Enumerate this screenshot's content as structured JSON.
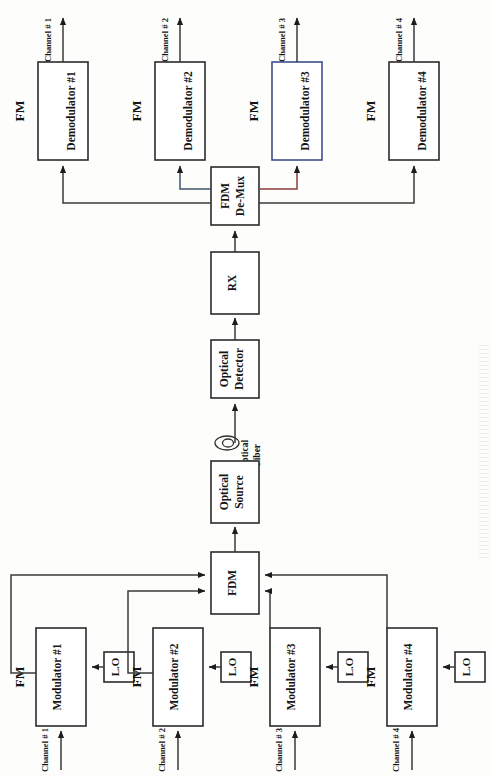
{
  "figure": {
    "kind": "block-diagram",
    "orientation": "rotated-90-ccw"
  },
  "transmitter": {
    "channels": [
      {
        "channel_label": "Channel # 1",
        "fm_label": "FM",
        "block_label": "Modulator #1",
        "lo_label": "L.O"
      },
      {
        "channel_label": "Channel # 2",
        "fm_label": "FM",
        "block_label": "Modulator #2",
        "lo_label": "L.O"
      },
      {
        "channel_label": "Channel # 3",
        "fm_label": "FM",
        "block_label": "Modulator #3",
        "lo_label": "L.O"
      },
      {
        "channel_label": "Channel # 4",
        "fm_label": "FM",
        "block_label": "Modulator #4",
        "lo_label": "L.O"
      }
    ],
    "mux_label": "FDM",
    "optical_source_line1": "Optical",
    "optical_source_line2": "Source"
  },
  "link": {
    "fiber_line1": "Optical",
    "fiber_line2": "Fiber"
  },
  "receiver": {
    "optical_detector_line1": "Optical",
    "optical_detector_line2": "Detector",
    "rx_label": "RX",
    "demux_line1": "FDM",
    "demux_line2": "De-Mux",
    "channels": [
      {
        "channel_label": "Channel # 1",
        "fm_label": "FM",
        "block_label": "Demodulator #1"
      },
      {
        "channel_label": "Channel # 2",
        "fm_label": "FM",
        "block_label": "Demodulator #2"
      },
      {
        "channel_label": "Channel # 3",
        "fm_label": "FM",
        "block_label": "Demodulator #3"
      },
      {
        "channel_label": "Channel # 4",
        "fm_label": "FM",
        "block_label": "Demodulator #4"
      }
    ]
  },
  "colors": {
    "line": "#3a3a3a",
    "box_stroke": "#2b2b2b",
    "accent_red": "#8d3c3c",
    "accent_blue": "#41556b",
    "background": "#fdfdfc"
  }
}
